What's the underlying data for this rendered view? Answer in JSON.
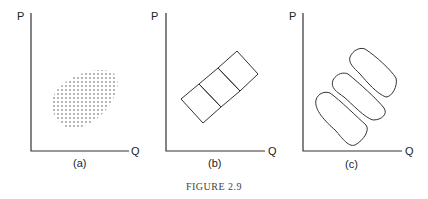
{
  "figure": {
    "caption": "FIGURE 2.9",
    "panels": [
      {
        "id": "a",
        "label": "(a)",
        "y_axis": "P",
        "x_axis": "Q",
        "description": "single dotted oval cluster"
      },
      {
        "id": "b",
        "label": "(b)",
        "y_axis": "P",
        "x_axis": "Q",
        "description": "tilted rectangle split into three regions: dashes, circles, crosses"
      },
      {
        "id": "c",
        "label": "(c)",
        "y_axis": "P",
        "x_axis": "Q",
        "description": "three separate tilted blobs: dashes, circles, crosses"
      }
    ]
  }
}
